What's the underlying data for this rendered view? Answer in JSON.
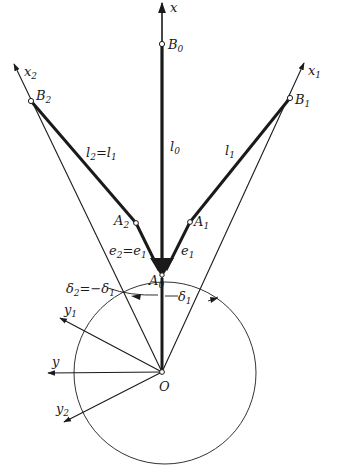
{
  "figure": {
    "type": "kinematic-linkage-diagram",
    "colors": {
      "ink": "#1a1a1a",
      "background": "#ffffff"
    },
    "axes": {
      "x": "x",
      "x1": "x",
      "x1_sub": "1",
      "x2": "x",
      "x2_sub": "2",
      "y": "y",
      "y1": "y",
      "y1_sub": "1",
      "y2": "y",
      "y2_sub": "2"
    },
    "points": {
      "B0": {
        "main": "B",
        "sub": "0"
      },
      "B1": {
        "main": "B",
        "sub": "1"
      },
      "B2": {
        "main": "B",
        "sub": "2"
      },
      "A0": {
        "main": "A",
        "sub": "0"
      },
      "A1": {
        "main": "A",
        "sub": "1"
      },
      "A2": {
        "main": "A",
        "sub": "2"
      },
      "O": {
        "main": "O"
      }
    },
    "links": {
      "l0": {
        "main": "l",
        "sub": "0"
      },
      "l1": {
        "main": "l",
        "sub": "1"
      },
      "l2_eq": {
        "a": "l",
        "a_sub": "2",
        "eq": "=",
        "b": "l",
        "b_sub": "1"
      },
      "e1": {
        "main": "e",
        "sub": "1"
      },
      "e2_eq": {
        "a": "e",
        "a_sub": "2",
        "eq": "=",
        "b": "e",
        "b_sub": "1"
      }
    },
    "angles": {
      "delta1": {
        "main": "δ",
        "sub": "1"
      },
      "delta2_eq": {
        "a": "δ",
        "a_sub": "2",
        "eq": "=−",
        "b": "δ",
        "b_sub": "1"
      }
    }
  }
}
